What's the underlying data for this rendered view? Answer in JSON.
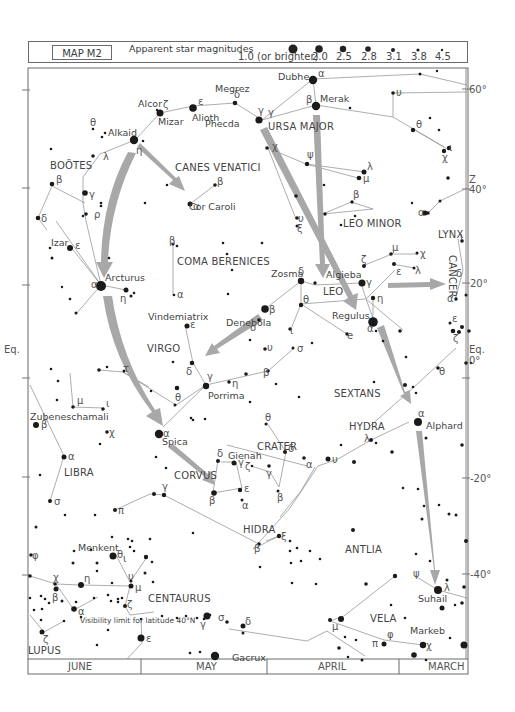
{
  "header": {
    "map_id": "MAP M2",
    "magnitudes_title": "Apparent star magnitudes",
    "magnitudes": [
      {
        "label": "1.0 (or brighter)",
        "r": 5
      },
      {
        "label": "2.0",
        "r": 4
      },
      {
        "label": "2.5",
        "r": 3.5
      },
      {
        "label": "2.8",
        "r": 3
      },
      {
        "label": "3.1",
        "r": 2.2
      },
      {
        "label": "3.8",
        "r": 1.8
      },
      {
        "label": "4.5",
        "r": 1.3
      }
    ]
  },
  "constellations": [
    {
      "name": "BOÖTES",
      "x": 50,
      "y": 169
    },
    {
      "name": "CANES VENATICI",
      "x": 175,
      "y": 171
    },
    {
      "name": "URSA MAJOR",
      "x": 268,
      "y": 130
    },
    {
      "name": "LEO MINOR",
      "x": 343,
      "y": 227
    },
    {
      "name": "LYNX",
      "x": 438,
      "y": 238
    },
    {
      "name": "COMA BERENICES",
      "x": 177,
      "y": 265
    },
    {
      "name": "LEO",
      "x": 323,
      "y": 295
    },
    {
      "name": "VIRGO",
      "x": 147,
      "y": 352
    },
    {
      "name": "SEXTANS",
      "x": 334,
      "y": 397
    },
    {
      "name": "HYDRA",
      "x": 349,
      "y": 430
    },
    {
      "name": "CRATER",
      "x": 257,
      "y": 450
    },
    {
      "name": "LIBRA",
      "x": 64,
      "y": 476
    },
    {
      "name": "CORVUS",
      "x": 174,
      "y": 479
    },
    {
      "name": "HIDRA",
      "x": 243,
      "y": 533
    },
    {
      "name": "ANTLIA",
      "x": 345,
      "y": 553
    },
    {
      "name": "CENTAURUS",
      "x": 148,
      "y": 602
    },
    {
      "name": "VELA",
      "x": 370,
      "y": 622
    },
    {
      "name": "LUPUS",
      "x": 28,
      "y": 654
    }
  ],
  "cancer_label": "CANCER",
  "star_names": [
    {
      "name": "Dubhe",
      "x": 278,
      "y": 80
    },
    {
      "name": "Megrez",
      "x": 215,
      "y": 92
    },
    {
      "name": "Merak",
      "x": 320,
      "y": 102
    },
    {
      "name": "Alcor",
      "x": 138,
      "y": 107
    },
    {
      "name": "Mizar",
      "x": 158,
      "y": 125
    },
    {
      "name": "Alioth",
      "x": 192,
      "y": 121
    },
    {
      "name": "Phecda",
      "x": 205,
      "y": 127
    },
    {
      "name": "Alkaid",
      "x": 108,
      "y": 136
    },
    {
      "name": "Cor Caroli",
      "x": 189,
      "y": 210
    },
    {
      "name": "Izar",
      "x": 51,
      "y": 246
    },
    {
      "name": "Arcturus",
      "x": 105,
      "y": 281
    },
    {
      "name": "Zosma",
      "x": 271,
      "y": 277
    },
    {
      "name": "Algieba",
      "x": 326,
      "y": 278
    },
    {
      "name": "Regulus",
      "x": 332,
      "y": 319
    },
    {
      "name": "Vindemiatrix",
      "x": 148,
      "y": 320
    },
    {
      "name": "Denebola",
      "x": 226,
      "y": 326
    },
    {
      "name": "Porrima",
      "x": 208,
      "y": 399
    },
    {
      "name": "Zubeneschamali",
      "x": 30,
      "y": 420
    },
    {
      "name": "Alphard",
      "x": 426,
      "y": 429
    },
    {
      "name": "Spica",
      "x": 162,
      "y": 445
    },
    {
      "name": "Gienah",
      "x": 228,
      "y": 459
    },
    {
      "name": "Menkent",
      "x": 78,
      "y": 551
    },
    {
      "name": "Suhail",
      "x": 418,
      "y": 602
    },
    {
      "name": "Markeb",
      "x": 410,
      "y": 634
    },
    {
      "name": "Gacrux",
      "x": 232,
      "y": 661
    }
  ],
  "visibility_note": "Visibility limit for latitude 40°N",
  "declinations": [
    {
      "label": "60°",
      "y": 89
    },
    {
      "label": "40°",
      "y": 191
    },
    {
      "label": "20°",
      "y": 283
    },
    {
      "label": "Eq.",
      "y": 349
    },
    {
      "label": "0°",
      "y": 362
    },
    {
      "label": "-20°",
      "y": 479
    },
    {
      "label": "-40°",
      "y": 574
    }
  ],
  "left_eq_label": "Eq.",
  "right_z_label": "Z",
  "months": [
    "JUNE",
    "MAY",
    "APRIL",
    "MARCH"
  ]
}
